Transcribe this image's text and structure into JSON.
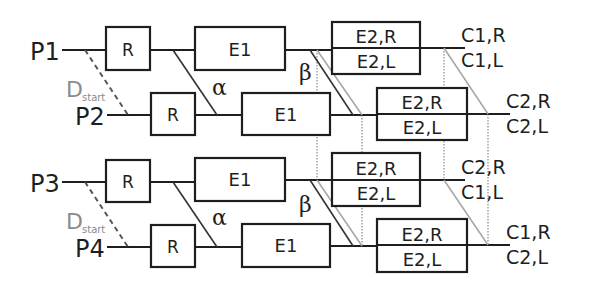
{
  "diagram": {
    "ports": {
      "p1": "P1",
      "p2": "P2",
      "p3": "P3",
      "p4": "P4"
    },
    "d_start": {
      "main": "D",
      "sub": "start"
    },
    "greek": {
      "alpha": "α",
      "beta": "β"
    },
    "blocks": {
      "r": "R",
      "e1": "E1",
      "e2r": "E2,R",
      "e2l": "E2,L"
    },
    "outputs": [
      {
        "top": "C1,R",
        "bottom": "C1,L"
      },
      {
        "top": "C2,R",
        "bottom": "C2,L"
      },
      {
        "top": "C2,R",
        "bottom": "C1,L"
      },
      {
        "top": "C1,R",
        "bottom": "C2,L"
      }
    ]
  }
}
